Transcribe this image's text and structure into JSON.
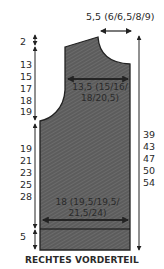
{
  "title": "RECHTES VORDERTEIL",
  "colors": {
    "fill": "#5a5a5a",
    "stroke": "#222222",
    "text": "#2a2a2a"
  },
  "top_measure": "5,5 (6/6,5/8/9)",
  "chest_measure": {
    "line1": "13,5 (15/16/",
    "line2": "18/20,5)"
  },
  "bottom_measure": {
    "line1": "18 (19,5/19,5/",
    "line2": "21,5/24)"
  },
  "left_labels": {
    "shoulder": "2",
    "armhole": [
      "13",
      "15",
      "17",
      "18",
      "19"
    ],
    "body": [
      "19",
      "21",
      "23",
      "25",
      "28"
    ],
    "rib": "5"
  },
  "right_labels": [
    "39",
    "43",
    "47",
    "50",
    "54"
  ]
}
